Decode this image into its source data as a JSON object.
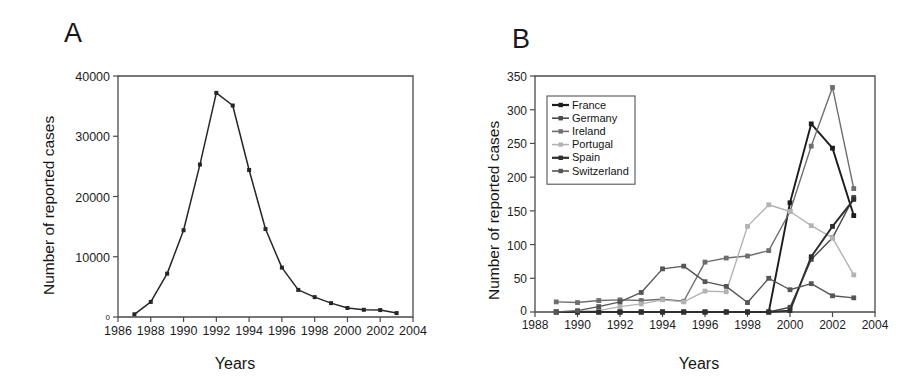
{
  "figure": {
    "panel_a_letter": "A",
    "panel_b_letter": "B"
  },
  "chart_data": [
    {
      "panel": "A",
      "type": "line",
      "title": "",
      "xlabel": "Years",
      "ylabel": "Number of reported cases",
      "xlim": [
        1986,
        2004
      ],
      "ylim": [
        0,
        40000
      ],
      "xticks": [
        1986,
        1988,
        1990,
        1992,
        1994,
        1996,
        1998,
        2000,
        2002,
        2004
      ],
      "yticks": [
        0,
        10000,
        20000,
        30000,
        40000
      ],
      "ytick_labels": [
        "0",
        "10000",
        "20000",
        "30000",
        "40000"
      ],
      "grid": false,
      "legend": "none",
      "marker": "filled-square",
      "series": [
        {
          "name": "United Kingdom",
          "color": "#262626",
          "x": [
            1987,
            1988,
            1989,
            1990,
            1991,
            1992,
            1993,
            1994,
            1995,
            1996,
            1997,
            1998,
            1999,
            2000,
            2001,
            2002,
            2003
          ],
          "values": [
            450,
            2500,
            7200,
            14400,
            25300,
            37200,
            35100,
            24400,
            14600,
            8200,
            4500,
            3300,
            2300,
            1500,
            1200,
            1150,
            650
          ]
        }
      ]
    },
    {
      "panel": "B",
      "type": "line",
      "title": "",
      "xlabel": "Years",
      "ylabel": "Number of reported cases",
      "xlim": [
        1988,
        2004
      ],
      "ylim": [
        0,
        350
      ],
      "xticks": [
        1988,
        1990,
        1992,
        1994,
        1996,
        1998,
        2000,
        2002,
        2004
      ],
      "yticks": [
        0,
        50,
        100,
        150,
        200,
        250,
        300,
        350
      ],
      "ytick_labels": [
        "0",
        "50",
        "100",
        "150",
        "200",
        "250",
        "300",
        "350"
      ],
      "grid": false,
      "legend": "upper-left-inset",
      "marker": "filled-square",
      "categories": [
        1989,
        1990,
        1991,
        1992,
        1993,
        1994,
        1995,
        1996,
        1997,
        1998,
        1999,
        2000,
        2001,
        2002,
        2003
      ],
      "series": [
        {
          "name": "France",
          "color": "#1c1c1c",
          "x": [
            1989,
            1990,
            1991,
            1992,
            1993,
            1994,
            1995,
            1996,
            1997,
            1998,
            1999,
            2000,
            2001,
            2002,
            2003
          ],
          "values": [
            0,
            0,
            0,
            0,
            0,
            0,
            0,
            0,
            0,
            0,
            0,
            162,
            279,
            243,
            143
          ]
        },
        {
          "name": "Germany",
          "color": "#4a4a4a",
          "x": [
            1989,
            1990,
            1991,
            1992,
            1993,
            1994,
            1995,
            1996,
            1997,
            1998,
            1999,
            2000,
            2001,
            2002,
            2003
          ],
          "values": [
            0,
            0,
            0,
            0,
            0,
            0,
            0,
            0,
            0,
            0,
            0,
            7,
            78,
            110,
            170
          ]
        },
        {
          "name": "Ireland",
          "color": "#6e6e6e",
          "x": [
            1989,
            1990,
            1991,
            1992,
            1993,
            1994,
            1995,
            1996,
            1997,
            1998,
            1999,
            2000,
            2001,
            2002,
            2003
          ],
          "values": [
            15,
            14,
            17,
            18,
            17,
            19,
            16,
            74,
            80,
            83,
            91,
            149,
            246,
            333,
            183
          ]
        },
        {
          "name": "Portugal",
          "color": "#b3b3b3",
          "x": [
            1989,
            1990,
            1991,
            1992,
            1993,
            1994,
            1995,
            1996,
            1997,
            1998,
            1999,
            2000,
            2001,
            2002,
            2003
          ],
          "values": [
            0,
            1,
            2,
            8,
            12,
            18,
            15,
            31,
            30,
            127,
            159,
            149,
            128,
            110,
            55
          ]
        },
        {
          "name": "Spain",
          "color": "#2e2e2e",
          "x": [
            1989,
            1990,
            1991,
            1992,
            1993,
            1994,
            1995,
            1996,
            1997,
            1998,
            1999,
            2000,
            2001,
            2002,
            2003
          ],
          "values": [
            0,
            0,
            0,
            0,
            0,
            0,
            0,
            0,
            0,
            0,
            0,
            2,
            82,
            127,
            167
          ]
        },
        {
          "name": "Switzerland",
          "color": "#555555",
          "x": [
            1989,
            1990,
            1991,
            1992,
            1993,
            1994,
            1995,
            1996,
            1997,
            1998,
            1999,
            2000,
            2001,
            2002,
            2003
          ],
          "values": [
            0,
            2,
            8,
            15,
            29,
            64,
            68,
            45,
            38,
            14,
            50,
            33,
            42,
            24,
            21
          ]
        }
      ]
    }
  ]
}
